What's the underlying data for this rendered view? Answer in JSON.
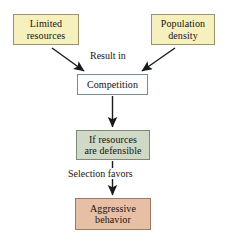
{
  "diagram": {
    "background_color": "#ffffff",
    "nodes": [
      {
        "id": "limited-resources",
        "lines": [
          "Limited",
          "resources"
        ],
        "fill": "#f6f0bd",
        "border": "#9a9170"
      },
      {
        "id": "population-density",
        "lines": [
          "Population",
          "density"
        ],
        "fill": "#f6f0bd",
        "border": "#9a9170"
      },
      {
        "id": "competition",
        "lines": [
          "Competition"
        ],
        "fill": "#fbfdfe",
        "border": "#7e8a90"
      },
      {
        "id": "if-resources-defensible",
        "lines": [
          "If resources",
          "are defensible"
        ],
        "fill": "#cfd9c6",
        "border": "#7e8a76"
      },
      {
        "id": "aggressive-behavior",
        "lines": [
          "Aggressive",
          "behavior"
        ],
        "fill": "#e7bfa4",
        "border": "#9b7b63"
      }
    ],
    "edge_labels": {
      "result_in": "Result in",
      "selection_favors": "Selection favors"
    },
    "arrow_color": "#1a1a1a"
  }
}
